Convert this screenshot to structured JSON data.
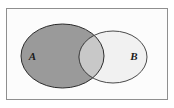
{
  "figure": {
    "kind": "venn-diagram",
    "title": "",
    "universe": {
      "label": "",
      "border_color": "#8f8f8f",
      "fill_color": "#fcfcfc",
      "x": 6,
      "y": 8,
      "width": 162,
      "height": 92
    },
    "sets": [
      {
        "id": "A",
        "label": "A",
        "fill_color": "#9a9a9a",
        "stroke_color": "#2b2b2b",
        "cx": 62.5,
        "cy": 56,
        "rx": 41.5,
        "ry": 32,
        "label_x": 32.5,
        "label_y": 59.5
      },
      {
        "id": "B",
        "label": "B",
        "fill_color": "#f1f1f1",
        "stroke_color": "#4a4a4a",
        "cx": 113,
        "cy": 57,
        "rx": 34,
        "ry": 26,
        "label_x": 134,
        "label_y": 60
      }
    ],
    "intersection": {
      "label": "",
      "fill_color": "#c8c8c8"
    }
  }
}
